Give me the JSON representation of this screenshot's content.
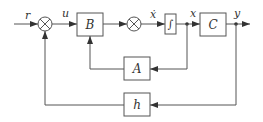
{
  "diagram": {
    "type": "block-diagram",
    "signals": {
      "input": "r",
      "control": "u",
      "state_derivative": "ẋ",
      "state": "x",
      "output": "y"
    },
    "blocks": {
      "B": "B",
      "integrator": "∫",
      "C": "C",
      "A": "A",
      "h": "h"
    },
    "junctions": [
      "summing-junction-1",
      "summing-junction-2"
    ],
    "connections": [
      {
        "from": "r",
        "to": "summing-junction-1"
      },
      {
        "from": "summing-junction-1",
        "to": "B",
        "label": "u"
      },
      {
        "from": "B",
        "to": "summing-junction-2"
      },
      {
        "from": "summing-junction-2",
        "to": "integrator",
        "label": "ẋ"
      },
      {
        "from": "integrator",
        "to": "C",
        "label": "x"
      },
      {
        "from": "C",
        "to": "output",
        "label": "y"
      },
      {
        "from": "x",
        "to": "A"
      },
      {
        "from": "A",
        "to": "B"
      },
      {
        "from": "y",
        "to": "h"
      },
      {
        "from": "h",
        "to": "summing-junction-1"
      }
    ]
  }
}
